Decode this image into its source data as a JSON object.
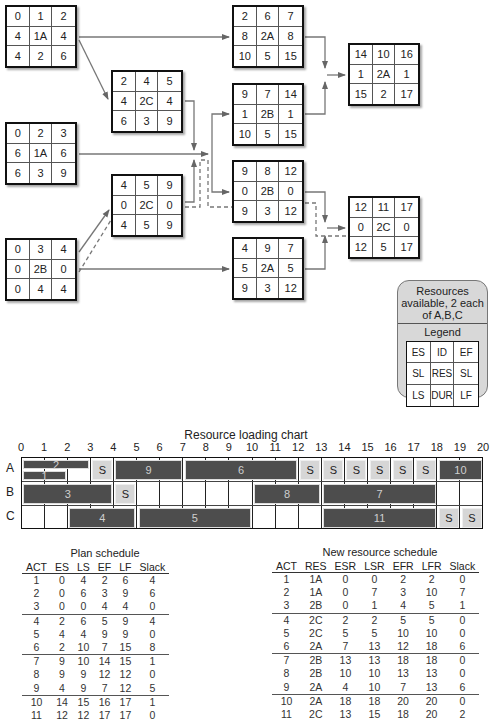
{
  "network": {
    "nodes": [
      {
        "id": "n1",
        "act": 1,
        "cells": [
          "0",
          "1",
          "2",
          "4",
          "1A",
          "4",
          "4",
          "2",
          "6"
        ]
      },
      {
        "id": "n2",
        "act": 2,
        "cells": [
          "0",
          "2",
          "3",
          "6",
          "1A",
          "6",
          "6",
          "3",
          "9"
        ]
      },
      {
        "id": "n3",
        "act": 3,
        "cells": [
          "0",
          "3",
          "4",
          "0",
          "2B",
          "0",
          "0",
          "4",
          "4"
        ]
      },
      {
        "id": "n4",
        "act": 4,
        "cells": [
          "2",
          "4",
          "5",
          "4",
          "2C",
          "4",
          "6",
          "3",
          "9"
        ]
      },
      {
        "id": "n5",
        "act": 5,
        "cells": [
          "4",
          "5",
          "9",
          "0",
          "2C",
          "0",
          "4",
          "5",
          "9"
        ]
      },
      {
        "id": "n6",
        "act": 6,
        "cells": [
          "2",
          "6",
          "7",
          "8",
          "2A",
          "8",
          "10",
          "5",
          "15"
        ]
      },
      {
        "id": "n7",
        "act": 7,
        "cells": [
          "9",
          "7",
          "14",
          "1",
          "2B",
          "1",
          "10",
          "5",
          "15"
        ]
      },
      {
        "id": "n8",
        "act": 8,
        "cells": [
          "9",
          "8",
          "12",
          "0",
          "2B",
          "0",
          "9",
          "3",
          "12"
        ]
      },
      {
        "id": "n9",
        "act": 9,
        "cells": [
          "4",
          "9",
          "7",
          "5",
          "2A",
          "5",
          "9",
          "3",
          "12"
        ]
      },
      {
        "id": "n10",
        "act": 10,
        "cells": [
          "14",
          "10",
          "16",
          "1",
          "2A",
          "1",
          "15",
          "2",
          "17"
        ]
      },
      {
        "id": "n11",
        "act": 11,
        "cells": [
          "12",
          "11",
          "17",
          "0",
          "2C",
          "0",
          "12",
          "5",
          "17"
        ]
      }
    ]
  },
  "legend": {
    "resources_text": "Resources available, 2 each of A,B,C",
    "title": "Legend",
    "cells": [
      "ES",
      "ID",
      "EF",
      "SL",
      "RES",
      "SL",
      "LS",
      "DUR",
      "LF"
    ]
  },
  "chart_data": {
    "type": "table",
    "title": "Resource loading chart",
    "x_ticks": [
      "0",
      "1",
      "2",
      "3",
      "4",
      "5",
      "6",
      "7",
      "8",
      "9",
      "10",
      "11",
      "12",
      "13",
      "14",
      "15",
      "16",
      "17",
      "18",
      "19",
      "20"
    ],
    "rows": [
      "A",
      "B",
      "C"
    ],
    "bars": [
      {
        "row": "A",
        "label": "2",
        "start": 0,
        "end": 3,
        "lane": "top"
      },
      {
        "row": "A",
        "label": "1",
        "start": 0,
        "end": 2,
        "lane": "bottom"
      },
      {
        "row": "A",
        "label": "9",
        "start": 4,
        "end": 7
      },
      {
        "row": "A",
        "label": "6",
        "start": 7,
        "end": 12
      },
      {
        "row": "A",
        "label": "10",
        "start": 18,
        "end": 20
      },
      {
        "row": "B",
        "label": "3",
        "start": 0,
        "end": 4
      },
      {
        "row": "B",
        "label": "8",
        "start": 10,
        "end": 13
      },
      {
        "row": "B",
        "label": "7",
        "start": 13,
        "end": 18
      },
      {
        "row": "C",
        "label": "4",
        "start": 2,
        "end": 5
      },
      {
        "row": "C",
        "label": "5",
        "start": 5,
        "end": 10
      },
      {
        "row": "C",
        "label": "11",
        "start": 13,
        "end": 18
      }
    ],
    "slack": [
      {
        "row": "A",
        "label": "S",
        "start": 3,
        "end": 4
      },
      {
        "row": "A",
        "label": "S",
        "start": 12,
        "end": 13
      },
      {
        "row": "A",
        "label": "S",
        "start": 13,
        "end": 14
      },
      {
        "row": "A",
        "label": "S",
        "start": 14,
        "end": 15
      },
      {
        "row": "A",
        "label": "S",
        "start": 15,
        "end": 16
      },
      {
        "row": "A",
        "label": "S",
        "start": 16,
        "end": 17
      },
      {
        "row": "A",
        "label": "S",
        "start": 17,
        "end": 18
      },
      {
        "row": "B",
        "label": "S",
        "start": 4,
        "end": 5
      },
      {
        "row": "C",
        "label": "S",
        "start": 18,
        "end": 19
      },
      {
        "row": "C",
        "label": "S",
        "start": 19,
        "end": 20
      }
    ]
  },
  "plan_schedule": {
    "title": "Plan schedule",
    "headers": [
      "ACT",
      "ES",
      "LS",
      "EF",
      "LF",
      "Slack"
    ],
    "rows": [
      [
        "1",
        "0",
        "4",
        "2",
        "6",
        "4"
      ],
      [
        "2",
        "0",
        "6",
        "3",
        "9",
        "6"
      ],
      [
        "3",
        "0",
        "0",
        "4",
        "4",
        "0"
      ],
      [
        "4",
        "2",
        "6",
        "5",
        "9",
        "4"
      ],
      [
        "5",
        "4",
        "4",
        "9",
        "9",
        "0"
      ],
      [
        "6",
        "2",
        "10",
        "7",
        "15",
        "8"
      ],
      [
        "7",
        "9",
        "10",
        "14",
        "15",
        "1"
      ],
      [
        "8",
        "9",
        "9",
        "12",
        "12",
        "0"
      ],
      [
        "9",
        "4",
        "9",
        "7",
        "12",
        "5"
      ],
      [
        "10",
        "14",
        "15",
        "16",
        "17",
        "1"
      ],
      [
        "11",
        "12",
        "12",
        "17",
        "17",
        "0"
      ]
    ]
  },
  "new_schedule": {
    "title": "New resource schedule",
    "headers": [
      "ACT",
      "RES",
      "ESR",
      "LSR",
      "EFR",
      "LFR",
      "Slack"
    ],
    "rows": [
      [
        "1",
        "1A",
        "0",
        "0",
        "2",
        "2",
        "0"
      ],
      [
        "2",
        "1A",
        "0",
        "7",
        "3",
        "10",
        "7"
      ],
      [
        "3",
        "2B",
        "0",
        "1",
        "4",
        "5",
        "1"
      ],
      [
        "4",
        "2C",
        "2",
        "2",
        "5",
        "5",
        "0"
      ],
      [
        "5",
        "2C",
        "5",
        "5",
        "10",
        "10",
        "0"
      ],
      [
        "6",
        "2A",
        "7",
        "13",
        "12",
        "18",
        "6"
      ],
      [
        "7",
        "2B",
        "13",
        "13",
        "18",
        "18",
        "0"
      ],
      [
        "8",
        "2B",
        "10",
        "10",
        "13",
        "13",
        "0"
      ],
      [
        "9",
        "2A",
        "4",
        "10",
        "7",
        "13",
        "6"
      ],
      [
        "10",
        "2A",
        "18",
        "18",
        "20",
        "20",
        "0"
      ],
      [
        "11",
        "2C",
        "13",
        "15",
        "18",
        "20",
        "2"
      ]
    ]
  }
}
